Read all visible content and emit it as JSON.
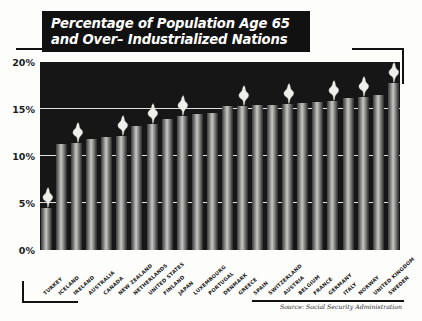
{
  "title": {
    "line1": "Percentage of Population Age 65",
    "line2": "and Over– Industrialized Nations"
  },
  "source": "Source: Social Security Administration",
  "colors": {
    "banner_bg": "#111111",
    "banner_text": "#ffffff",
    "plot_bg": "#161616",
    "gridline": "#f2f2ee",
    "bar_light": "#c8c8c4",
    "bar_dark": "#2b2b2b",
    "highlight": "#eeeeea",
    "page_bg": "#fdfdfc"
  },
  "chart_data": {
    "type": "bar",
    "title": "Percentage of Population Age 65 and Over– Industrialized Nations",
    "xlabel": "",
    "ylabel": "",
    "ylim": [
      0,
      20
    ],
    "ytick_labels": [
      "0%",
      "5%",
      "10%",
      "15%",
      "20%"
    ],
    "ytick_values": [
      0,
      5,
      10,
      15,
      20
    ],
    "grid": true,
    "legend": false,
    "orientation": "vertical",
    "categories": [
      "TURKEY",
      "ICELAND",
      "IRELAND",
      "AUSTRALIA",
      "CANADA",
      "NEW ZEALAND",
      "NETHERLANDS",
      "UNITED STATES",
      "FINLAND",
      "JAPAN",
      "LUXEMBOURG",
      "PORTUGAL",
      "DENMARK",
      "GREECE",
      "SPAIN",
      "SWITZERLAND",
      "AUSTRIA",
      "BELGIUM",
      "FRANCE",
      "GERMANY",
      "ITALY",
      "NORWAY",
      "UNITED KINGDOM",
      "SWEDEN"
    ],
    "values": [
      4.5,
      11.3,
      11.4,
      11.8,
      12.0,
      12.1,
      13.2,
      13.4,
      13.9,
      14.3,
      14.5,
      14.6,
      15.3,
      15.3,
      15.4,
      15.4,
      15.5,
      15.6,
      15.7,
      15.8,
      16.2,
      16.3,
      16.5,
      17.8
    ],
    "highlighted_bars": [
      0,
      2,
      5,
      7,
      9,
      13,
      16,
      19,
      21,
      23
    ],
    "highlight_marker": "flame-icon"
  }
}
